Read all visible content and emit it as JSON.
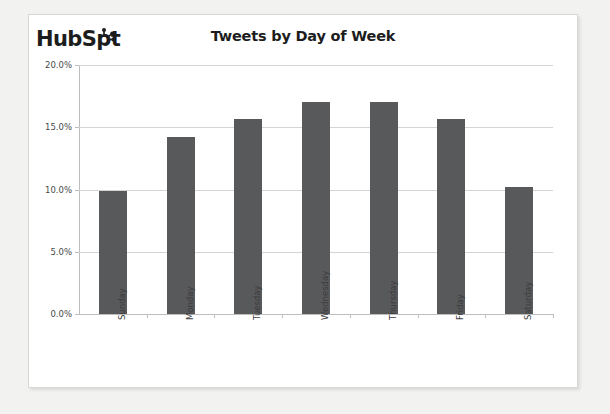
{
  "brand": {
    "name": "HubSpot",
    "text_before": "HubSp",
    "text_after": "t",
    "sprocket_icon": "hubspot-sprocket-icon"
  },
  "chart_data": {
    "type": "bar",
    "title": "Tweets by Day of Week",
    "xlabel": "",
    "ylabel": "",
    "categories": [
      "Sunday",
      "Monday",
      "Tuesday",
      "Wednesday",
      "Thursday",
      "Friday",
      "Saturday"
    ],
    "values": [
      9.9,
      14.2,
      15.7,
      17.0,
      17.0,
      15.7,
      10.2
    ],
    "value_labels": [
      "9.9%",
      "14.2%",
      "15.7%",
      "17.0%",
      "17.0%",
      "15.7%",
      "10.2%"
    ],
    "ylim": [
      0,
      20
    ],
    "ytick_values": [
      0,
      5,
      10,
      15,
      20
    ],
    "ytick_labels": [
      "0.0%",
      "5.0%",
      "10.0%",
      "15.0%",
      "20.0%"
    ],
    "grid": true,
    "legend": false,
    "bar_color": "#58595b",
    "gridline_color": "#d4d4d4",
    "axis_color": "#bdbdbd"
  }
}
